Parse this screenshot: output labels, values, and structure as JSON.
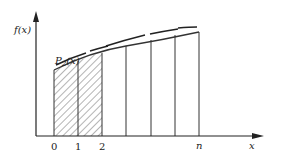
{
  "diagram": {
    "y_axis_label": "f(x)",
    "x_axis_label": "x",
    "curve_label_main": "P",
    "curve_label_sub": "2",
    "curve_label_arg": "(x)",
    "tick_labels": [
      "0",
      "1",
      "2",
      "n"
    ],
    "shaded_interval": "[0, 2]",
    "colors": {
      "line": "#333333",
      "axis": "#222222",
      "background": "#ffffff"
    }
  }
}
